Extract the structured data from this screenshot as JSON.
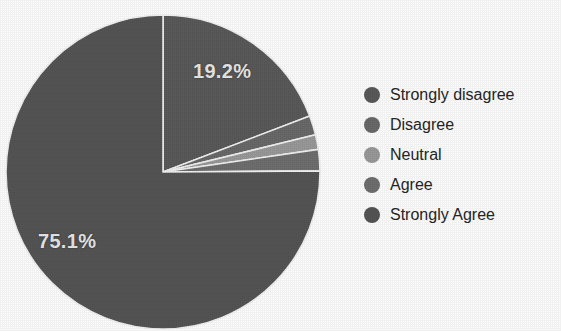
{
  "chart_data": {
    "type": "pie",
    "title": "",
    "subtitle": "",
    "xlabel": "",
    "ylabel": "",
    "grid": false,
    "legend_position": "right",
    "start_angle_deg": 0,
    "direction": "clockwise",
    "center": {
      "x": 163,
      "y": 172
    },
    "radius": 157,
    "categories": [
      "Strongly disagree",
      "Disagree",
      "Neutral",
      "Agree",
      "Strongly Agree"
    ],
    "values": [
      19.2,
      2.0,
      1.5,
      2.2,
      75.1
    ],
    "labels_shown": [
      "19.2%",
      "",
      "",
      "",
      "75.1%"
    ],
    "colors": [
      "#5a5a5a",
      "#6a6a6a",
      "#9a9a9a",
      "#6f6f6f",
      "#555555"
    ],
    "slice_border_color": "#f2f2f2",
    "slices": [
      {
        "name": "Strongly disagree",
        "value": 19.2,
        "label": "19.2%",
        "color": "#5a5a5a",
        "start_deg": 0.0,
        "end_deg": 69.1
      },
      {
        "name": "Disagree",
        "value": 2.0,
        "label": "",
        "color": "#6a6a6a",
        "start_deg": 69.1,
        "end_deg": 76.3
      },
      {
        "name": "Neutral",
        "value": 1.5,
        "label": "",
        "color": "#9a9a9a",
        "start_deg": 76.3,
        "end_deg": 81.7
      },
      {
        "name": "Agree",
        "value": 2.2,
        "label": "",
        "color": "#6f6f6f",
        "start_deg": 81.7,
        "end_deg": 89.6
      },
      {
        "name": "Strongly Agree",
        "value": 75.1,
        "label": "75.1%",
        "color": "#555555",
        "start_deg": 89.6,
        "end_deg": 360.0
      }
    ]
  },
  "labels": {
    "strongly_disagree_pct": "19.2%",
    "strongly_agree_pct": "75.1%"
  },
  "legend": {
    "items": [
      {
        "label": "Strongly disagree",
        "color": "#5a5a5a"
      },
      {
        "label": "Disagree",
        "color": "#6a6a6a"
      },
      {
        "label": "Neutral",
        "color": "#9a9a9a"
      },
      {
        "label": "Agree",
        "color": "#6f6f6f"
      },
      {
        "label": "Strongly Agree",
        "color": "#555555"
      }
    ]
  },
  "style": {
    "background": "#ffffff",
    "label_text_color": "#e9e9e9",
    "legend_text_color": "#262626",
    "slice_border_color": "#f2f2f2"
  }
}
